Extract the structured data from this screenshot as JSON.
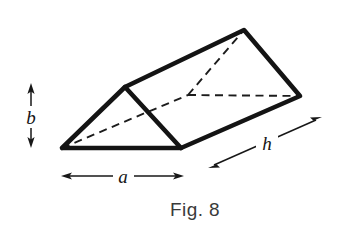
{
  "figure": {
    "caption": "Fig. 8",
    "background_color": "#ffffff",
    "ink_color": "#141414",
    "labels": {
      "height": "b",
      "base": "a",
      "length": "h"
    },
    "dimensions": {
      "base_label": "a",
      "base_description": "base width of triangular cross-section",
      "height_label": "b",
      "height_description": "height of triangular cross-section",
      "length_label": "h",
      "length_description": "length of prism"
    },
    "geometry": {
      "canvas": {
        "width": 352,
        "height": 231
      },
      "vertices": {
        "front_bottom_left": [
          62,
          148
        ],
        "front_apex": [
          125,
          87
        ],
        "front_bottom_right": [
          181,
          148
        ],
        "back_apex": [
          244,
          30
        ],
        "back_bottom_right": [
          300,
          96
        ],
        "back_bottom_left_hidden": [
          188,
          95
        ]
      },
      "solid_edges": [
        [
          [
            62,
            148
          ],
          [
            125,
            87
          ]
        ],
        [
          [
            125,
            87
          ],
          [
            181,
            148
          ]
        ],
        [
          [
            181,
            148
          ],
          [
            62,
            148
          ]
        ],
        [
          [
            125,
            87
          ],
          [
            244,
            30
          ]
        ],
        [
          [
            244,
            30
          ],
          [
            300,
            96
          ]
        ],
        [
          [
            300,
            96
          ],
          [
            181,
            148
          ]
        ]
      ],
      "hidden_edges": [
        [
          [
            62,
            148
          ],
          [
            188,
            95
          ]
        ],
        [
          [
            188,
            95
          ],
          [
            244,
            30
          ]
        ],
        [
          [
            188,
            95
          ],
          [
            300,
            96
          ]
        ]
      ],
      "faces": [
        {
          "name": "front-triangle-face",
          "points": "62,148 125,87 181,148"
        },
        {
          "name": "top-rectangular-face",
          "points": "125,87 244,30 300,96 181,148"
        }
      ]
    },
    "dimension_markers": {
      "height_arrow": {
        "name": "b",
        "orientation": "vertical",
        "x": 31,
        "y_top": 85,
        "y_bottom": 146,
        "label_x": 31,
        "label_y": 122
      },
      "base_arrow": {
        "name": "a",
        "orientation": "horizontal",
        "y": 176,
        "x_left": 63,
        "x_right": 182,
        "label_x": 123,
        "label_y": 182
      },
      "length_arrow": {
        "name": "h",
        "orientation": "diagonal",
        "x_start": 210,
        "y_start": 167,
        "x_end": 320,
        "y_end": 118,
        "label_x": 266,
        "label_y": 151
      }
    },
    "caption_position": {
      "x": 195,
      "y": 216
    }
  }
}
